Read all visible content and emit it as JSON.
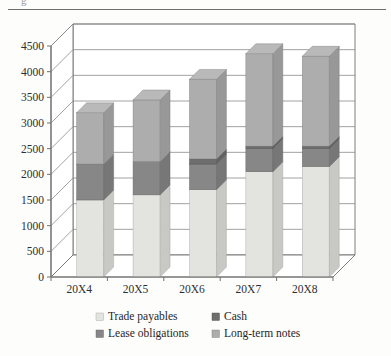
{
  "page": {
    "background_color": "#fdfdfc",
    "top_rule_color": "#6f6f6f",
    "ghost_glyph": "g"
  },
  "chart_data": {
    "type": "bar",
    "subtype": "stacked-column-3d",
    "title": "",
    "xlabel": "",
    "ylabel": "",
    "categories": [
      "20X4",
      "20X5",
      "20X6",
      "20X7",
      "20X8"
    ],
    "series": [
      {
        "name": "Trade payables",
        "color": "#e3e3e0",
        "values": [
          1500,
          1600,
          1700,
          2050,
          2150
        ]
      },
      {
        "name": "Lease obligations",
        "color": "#878787",
        "values": [
          700,
          650,
          500,
          450,
          350
        ]
      },
      {
        "name": "Cash",
        "color": "#6e6e6e",
        "values": [
          0,
          0,
          100,
          50,
          50
        ]
      },
      {
        "name": "Long-term notes",
        "color": "#adadad",
        "values": [
          1000,
          1200,
          1550,
          1800,
          1750
        ]
      }
    ],
    "totals": [
      3200,
      3450,
      3850,
      4350,
      4300
    ],
    "ylim": [
      0,
      4500
    ],
    "ytick_step": 500,
    "yticks": [
      "0",
      "500",
      "1000",
      "1500",
      "2000",
      "2500",
      "3000",
      "3500",
      "4000",
      "4500"
    ],
    "grid": true,
    "legend_position": "bottom",
    "legend": [
      {
        "label": "Trade payables",
        "color": "#e3e3e0"
      },
      {
        "label": "Cash",
        "color": "#6e6e6e"
      },
      {
        "label": "Lease obligations",
        "color": "#878787"
      },
      {
        "label": "Long-term notes",
        "color": "#adadad"
      }
    ]
  },
  "axes": {
    "y_ticks": [
      {
        "value": 4500,
        "label": "4500"
      },
      {
        "value": 4000,
        "label": "4000"
      },
      {
        "value": 3500,
        "label": "3500"
      },
      {
        "value": 3000,
        "label": "3000"
      },
      {
        "value": 2500,
        "label": "2500"
      },
      {
        "value": 2000,
        "label": "2000"
      },
      {
        "value": 1500,
        "label": "1500"
      },
      {
        "value": 1000,
        "label": "1000"
      },
      {
        "value": 500,
        "label": "500"
      },
      {
        "value": 0,
        "label": "0"
      }
    ],
    "x_ticks": [
      {
        "label": "20X4"
      },
      {
        "label": "20X5"
      },
      {
        "label": "20X6"
      },
      {
        "label": "20X7"
      },
      {
        "label": "20X8"
      }
    ],
    "axis_line_color": "#707070",
    "grid_line_color": "#8a8a8a"
  },
  "legend_items": [
    {
      "label": "Trade payables",
      "color": "#e3e3e0"
    },
    {
      "label": "Cash",
      "color": "#6e6e6e"
    },
    {
      "label": "Lease obligations",
      "color": "#878787"
    },
    {
      "label": "Long-term notes",
      "color": "#adadad"
    }
  ]
}
